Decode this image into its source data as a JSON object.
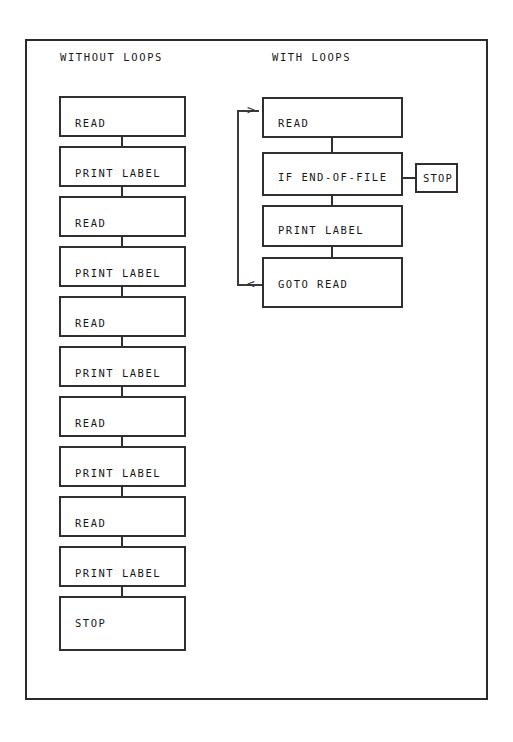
{
  "figure": {
    "frame_color": "#2b2b2b",
    "background": "#ffffff",
    "line_color": "#2f2f2f"
  },
  "columns": {
    "without_loops": {
      "heading": "WITHOUT LOOPS",
      "steps": [
        {
          "label": "READ"
        },
        {
          "label": "PRINT LABEL"
        },
        {
          "label": "READ"
        },
        {
          "label": "PRINT LABEL"
        },
        {
          "label": "READ"
        },
        {
          "label": "PRINT LABEL"
        },
        {
          "label": "READ"
        },
        {
          "label": "PRINT LABEL"
        },
        {
          "label": "READ"
        },
        {
          "label": "PRINT LABEL"
        },
        {
          "label": "STOP"
        }
      ]
    },
    "with_loops": {
      "heading": "WITH LOOPS",
      "steps": [
        {
          "label": "READ"
        },
        {
          "label": "IF END-OF-FILE"
        },
        {
          "label": "PRINT LABEL"
        },
        {
          "label": "GOTO READ"
        }
      ],
      "branch": {
        "label": "STOP"
      },
      "loop_arrow_in": ">",
      "loop_arrow_out": "<"
    }
  }
}
